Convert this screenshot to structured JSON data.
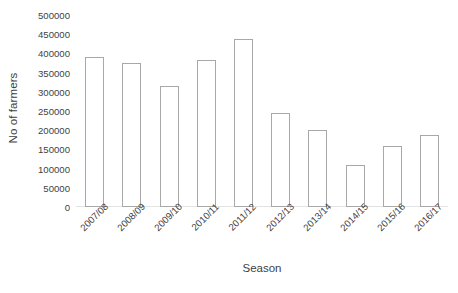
{
  "chart_data": {
    "type": "bar",
    "title": "",
    "xlabel": "Season",
    "ylabel": "No of farmers",
    "categories": [
      "2007/08",
      "2008/09",
      "2009/10",
      "2010/11",
      "2011/12",
      "2012/13",
      "2013/14",
      "2014/15",
      "2015/16",
      "2016/17"
    ],
    "values": [
      390000,
      375000,
      315000,
      383000,
      437000,
      245000,
      200000,
      110000,
      158000,
      188000
    ],
    "ylim": [
      0,
      500000
    ],
    "ytick_labels": [
      "0",
      "50000",
      "100000",
      "150000",
      "200000",
      "250000",
      "300000",
      "350000",
      "400000",
      "450000",
      "500000"
    ],
    "ytick_values": [
      0,
      50000,
      100000,
      150000,
      200000,
      250000,
      300000,
      350000,
      400000,
      450000,
      500000
    ],
    "grid": false,
    "legend": false,
    "bar_fill_color": "#ffffff",
    "bar_border_color": "#a8a8a8",
    "text_color": "#3f3f3f"
  }
}
